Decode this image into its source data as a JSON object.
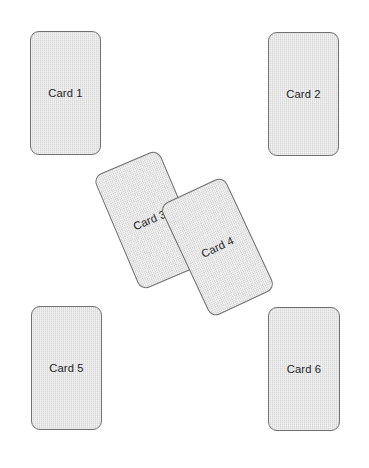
{
  "canvas": {
    "width": 369,
    "height": 468,
    "background_color": "#ffffff"
  },
  "style": {
    "card_fill_color": "#d7d7d7",
    "card_border_color": "#70716f",
    "label_text_color": "#23262b"
  },
  "cards": [
    {
      "id": "card-1",
      "label": "Card 1",
      "rotation_deg": 0,
      "x": 30,
      "y": 31,
      "width": 71,
      "height": 124
    },
    {
      "id": "card-2",
      "label": "Card 2",
      "rotation_deg": 0,
      "x": 268,
      "y": 32,
      "width": 71,
      "height": 124
    },
    {
      "id": "card-3",
      "label": "Card 3",
      "rotation_deg": -23,
      "x": 114,
      "y": 158,
      "width": 71,
      "height": 124
    },
    {
      "id": "card-4",
      "label": "Card 4",
      "rotation_deg": -25,
      "x": 182,
      "y": 185,
      "width": 71,
      "height": 124
    },
    {
      "id": "card-5",
      "label": "Card 5",
      "rotation_deg": 0,
      "x": 31,
      "y": 306,
      "width": 71,
      "height": 124
    },
    {
      "id": "card-6",
      "label": "Card 6",
      "rotation_deg": 0,
      "x": 268,
      "y": 307,
      "width": 72,
      "height": 124
    }
  ]
}
